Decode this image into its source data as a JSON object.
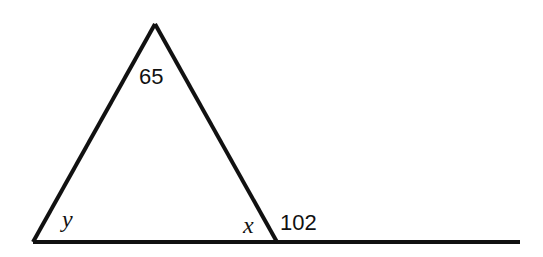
{
  "diagram": {
    "type": "geometry-triangle-exterior-angle",
    "stroke_color": "#111111",
    "background": "#ffffff",
    "vertices": {
      "apex": [
        155,
        24
      ],
      "left": [
        33,
        242
      ],
      "right": [
        277,
        242
      ]
    },
    "baseline_end": [
      520,
      242
    ],
    "labels": {
      "apex_angle": "65",
      "left_angle": "y",
      "right_interior_angle": "x",
      "exterior_angle": "102"
    }
  }
}
